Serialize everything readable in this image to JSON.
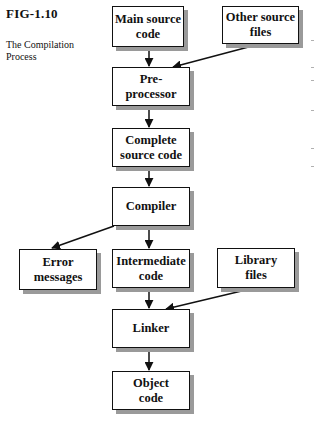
{
  "figure": {
    "label": "FIG-1.10",
    "caption": "The Compilation Process"
  },
  "nodes": [
    {
      "id": "main-source",
      "label": "Main source\ncode",
      "x": 112,
      "y": 6,
      "w": 72,
      "h": 41
    },
    {
      "id": "other-source",
      "label": "Other source\nfiles",
      "x": 222,
      "y": 6,
      "w": 77,
      "h": 38
    },
    {
      "id": "preprocessor",
      "label": "Pre-\nprocessor",
      "x": 112,
      "y": 67,
      "w": 78,
      "h": 39
    },
    {
      "id": "complete-source",
      "label": "Complete\nsource code",
      "x": 112,
      "y": 128,
      "w": 78,
      "h": 39
    },
    {
      "id": "compiler",
      "label": "Compiler",
      "x": 112,
      "y": 187,
      "w": 78,
      "h": 39
    },
    {
      "id": "error-messages",
      "label": "Error\nmessages",
      "x": 19,
      "y": 249,
      "w": 78,
      "h": 41
    },
    {
      "id": "intermediate-code",
      "label": "Intermediate\ncode",
      "x": 112,
      "y": 249,
      "w": 78,
      "h": 39
    },
    {
      "id": "library-files",
      "label": "Library\nfiles",
      "x": 217,
      "y": 248,
      "w": 78,
      "h": 40
    },
    {
      "id": "linker",
      "label": "Linker",
      "x": 112,
      "y": 309,
      "w": 78,
      "h": 39
    },
    {
      "id": "object-code",
      "label": "Object\ncode",
      "x": 112,
      "y": 371,
      "w": 78,
      "h": 39
    }
  ],
  "edges": [
    {
      "from": "main-source",
      "to": "preprocessor"
    },
    {
      "from": "other-source",
      "to": "preprocessor"
    },
    {
      "from": "preprocessor",
      "to": "complete-source"
    },
    {
      "from": "complete-source",
      "to": "compiler"
    },
    {
      "from": "compiler",
      "to": "error-messages"
    },
    {
      "from": "compiler",
      "to": "intermediate-code"
    },
    {
      "from": "intermediate-code",
      "to": "linker"
    },
    {
      "from": "library-files",
      "to": "linker"
    },
    {
      "from": "linker",
      "to": "object-code"
    }
  ],
  "colors": {
    "ink": "#111111",
    "shadow": "#9a9a9a",
    "background": "#ffffff"
  }
}
